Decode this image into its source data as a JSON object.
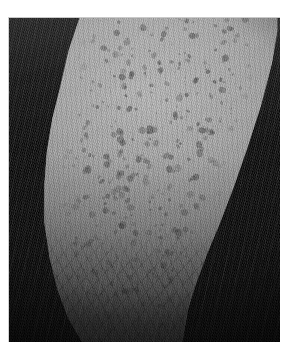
{
  "page": {
    "background_color": "#ffffff",
    "width": 293,
    "height": 354
  },
  "figure": {
    "name": "microscopy-figure",
    "frame_border_color": "#cccccc",
    "field_background_color": "#000000",
    "alt_text": "",
    "caption": ""
  },
  "image_content": {
    "modality": "grayscale reflectance microscopy",
    "subject": "curved tissue band with dense dark follicular spots",
    "palette": {
      "background": "#000000",
      "band_highlight": "#b9b9b9",
      "band_midtone": "#8e8e8e",
      "band_shadow": "#4a4a4a",
      "spot_color": "#3a3a3a"
    },
    "regions": [
      {
        "name": "dark-background-left",
        "description": "black field left of band"
      },
      {
        "name": "tissue-band",
        "description": "bright vertical curved strip"
      },
      {
        "name": "spot-field",
        "description": "dense dark round/oval openings"
      },
      {
        "name": "fibrous-zone-bottom",
        "description": "streaky fibre texture lower third"
      },
      {
        "name": "dark-background-right",
        "description": "black field right of band"
      }
    ]
  },
  "spots": {
    "count": 420,
    "min_size_px": 2,
    "max_size_px": 7,
    "seed": 20240917
  }
}
